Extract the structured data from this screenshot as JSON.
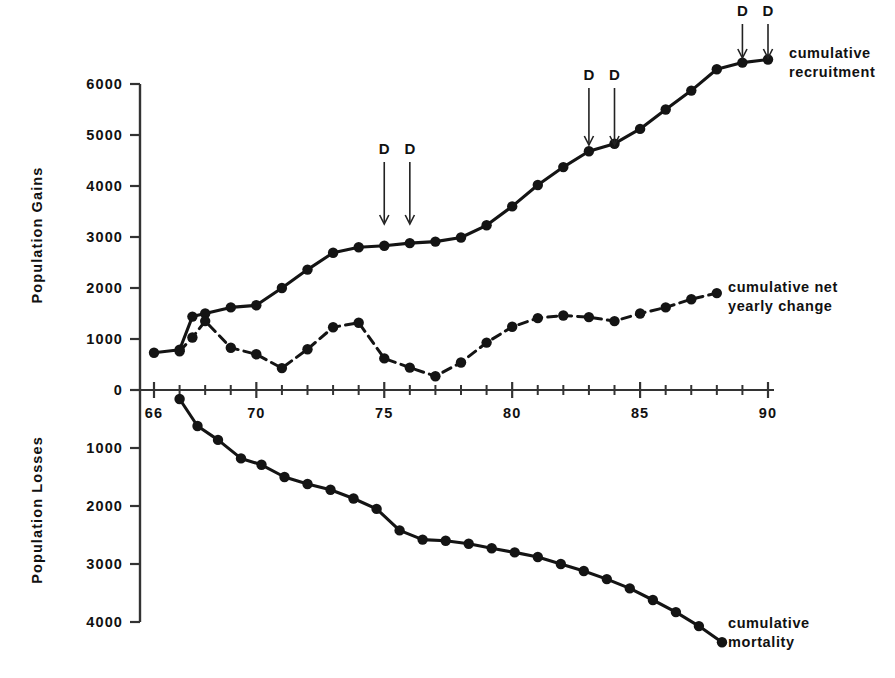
{
  "chart_data": {
    "type": "line",
    "title": "",
    "xlabel": "",
    "ylabel_top": "Population Gains",
    "ylabel_bottom": "Population Losses",
    "xlim": [
      65.3,
      90.6
    ],
    "xticks_labeled": [
      66,
      70,
      75,
      80,
      85,
      90
    ],
    "xtick_labels": [
      "66",
      "70",
      "75",
      "80",
      "85",
      "90"
    ],
    "xticks_minor": [
      67,
      68,
      69,
      71,
      72,
      73,
      74,
      76,
      77,
      78,
      79,
      81,
      82,
      83,
      84,
      86,
      87,
      88,
      89
    ],
    "ylim_top": [
      0,
      6000
    ],
    "yticks_top": [
      0,
      1000,
      2000,
      3000,
      4000,
      5000,
      6000
    ],
    "ytick_labels_top": [
      "0",
      "1000",
      "2000",
      "3000",
      "4000",
      "5000",
      "6000"
    ],
    "ylim_bottom": [
      0,
      4000
    ],
    "yticks_bottom": [
      0,
      1000,
      2000,
      3000,
      4000
    ],
    "ytick_labels_bottom": [
      "0",
      "1000",
      "2000",
      "3000",
      "4000"
    ],
    "grid": false,
    "legend_position": "right-inline",
    "series": [
      {
        "name": "cumulative recruitment",
        "label": "cumulative\nrecruitment",
        "label_line1": "cumulative",
        "label_line2": "recruitment",
        "style": "solid",
        "panel": "top",
        "marker": "filled-circle",
        "x": [
          66,
          67,
          67.5,
          68,
          69,
          70,
          71,
          72,
          73,
          74,
          75,
          76,
          77,
          78,
          79,
          80,
          81,
          82,
          83,
          84,
          85,
          86,
          87,
          88,
          89,
          90
        ],
        "y": [
          730,
          790,
          1440,
          1500,
          1620,
          1660,
          2000,
          2360,
          2690,
          2800,
          2830,
          2880,
          2910,
          2990,
          3230,
          3600,
          4020,
          4370,
          4680,
          4830,
          5120,
          5500,
          5870,
          6290,
          6420,
          6480
        ]
      },
      {
        "name": "cumulative net yearly change",
        "label_line1": "cumulative net",
        "label_line2": "yearly change",
        "style": "dashed",
        "panel": "top",
        "marker": "filled-circle",
        "x": [
          67,
          67.5,
          68,
          69,
          70,
          71,
          72,
          73,
          74,
          75,
          76,
          77,
          78,
          79,
          80,
          81,
          82,
          83,
          84,
          85,
          86,
          87,
          88
        ],
        "y": [
          760,
          1030,
          1350,
          830,
          700,
          430,
          800,
          1230,
          1320,
          620,
          440,
          270,
          540,
          930,
          1240,
          1410,
          1460,
          1430,
          1350,
          1500,
          1620,
          1780,
          1900
        ]
      },
      {
        "name": "cumulative mortality",
        "label_line1": "cumulative",
        "label_line2": "mortality",
        "style": "solid",
        "panel": "bottom",
        "marker": "filled-circle",
        "x": [
          67,
          67.7,
          68.5,
          69.4,
          70.2,
          71.1,
          72,
          72.9,
          73.8,
          74.7,
          75.6,
          76.5,
          77.4,
          78.3,
          79.2,
          80.1,
          81,
          81.9,
          82.8,
          83.7,
          84.6,
          85.5,
          86.4,
          87.3,
          88.2
        ],
        "y": [
          155,
          620,
          860,
          1180,
          1290,
          1500,
          1620,
          1720,
          1870,
          2050,
          2420,
          2580,
          2600,
          2650,
          2730,
          2800,
          2880,
          3000,
          3120,
          3260,
          3420,
          3620,
          3830,
          4070,
          4350
        ]
      }
    ],
    "annotations": [
      {
        "label": "D",
        "x": 75
      },
      {
        "label": "D",
        "x": 76
      },
      {
        "label": "D",
        "x": 83
      },
      {
        "label": "D",
        "x": 84
      },
      {
        "label": "D",
        "x": 89
      },
      {
        "label": "D",
        "x": 90
      }
    ],
    "colors": {
      "line": "#141414",
      "text": "#111111",
      "axis": "#333333",
      "background": "#ffffff"
    }
  }
}
